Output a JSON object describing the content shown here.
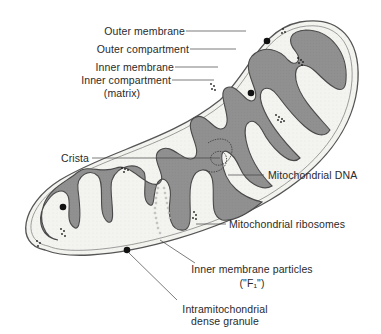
{
  "figure": {
    "colors": {
      "background": "#ffffff",
      "outer_compartment": "#f1f1ee",
      "matrix": "#8f8f8f",
      "membrane": "#5a5a5a",
      "granule": "#111111",
      "label_text": "#2a2a2a",
      "leader_line": "#444444"
    }
  },
  "labels": {
    "outer_membrane": "Outer membrane",
    "outer_compartment": "Outer compartment",
    "inner_membrane": "Inner membrane",
    "inner_compartment": "Inner compartment",
    "inner_compartment_sub": "(matrix)",
    "crista": "Crista",
    "mitochondrial_dna": "Mitochondrial DNA",
    "mitochondrial_ribosomes": "Mitochondrial ribosomes",
    "inner_membrane_particles": "Inner membrane particles",
    "inner_membrane_particles_sub": "(\"F₁\")",
    "dense_granule": "Intramitochondrial",
    "dense_granule_sub": "dense granule"
  }
}
